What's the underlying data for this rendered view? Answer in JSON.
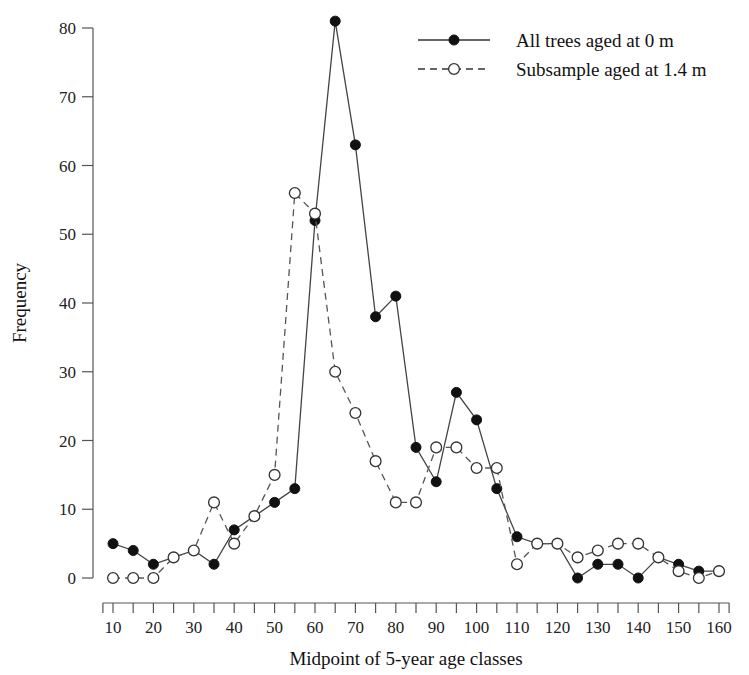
{
  "chart_data": {
    "type": "line",
    "title": "",
    "xlabel": "Midpoint of 5-year age classes",
    "ylabel": "Frequency",
    "xlim": [
      7.5,
      162.5
    ],
    "ylim": [
      0,
      84
    ],
    "grid": false,
    "legend_position": "top-right",
    "x_major_ticks": [
      10,
      20,
      30,
      40,
      50,
      60,
      70,
      80,
      90,
      100,
      110,
      120,
      130,
      140,
      150,
      160
    ],
    "x_minor_ticks": [
      15,
      25,
      35,
      45,
      55,
      65,
      75,
      85,
      95,
      105,
      115,
      125,
      135,
      145,
      155
    ],
    "y_ticks": [
      0,
      10,
      20,
      30,
      40,
      50,
      60,
      70,
      80
    ],
    "x": [
      10,
      15,
      20,
      25,
      30,
      35,
      40,
      45,
      50,
      55,
      60,
      65,
      70,
      75,
      80,
      85,
      90,
      95,
      100,
      105,
      110,
      115,
      120,
      125,
      130,
      135,
      140,
      145,
      150,
      155,
      160
    ],
    "series": [
      {
        "name": "All trees aged at 0 m",
        "marker": "filled-circle",
        "line": "solid",
        "color": "#111111",
        "values": [
          5,
          4,
          2,
          3,
          4,
          2,
          7,
          9,
          11,
          13,
          52,
          81,
          63,
          38,
          41,
          19,
          14,
          27,
          23,
          13,
          6,
          5,
          5,
          0,
          2,
          2,
          0,
          3,
          2,
          1,
          1
        ]
      },
      {
        "name": "Subsample aged at 1.4 m",
        "marker": "open-circle",
        "line": "dashed",
        "color": "#333333",
        "values": [
          0,
          0,
          0,
          3,
          4,
          11,
          5,
          9,
          15,
          56,
          53,
          30,
          24,
          17,
          11,
          11,
          19,
          19,
          16,
          16,
          2,
          5,
          5,
          3,
          4,
          5,
          5,
          3,
          1,
          0,
          1
        ]
      }
    ]
  },
  "legend": {
    "entries": [
      {
        "label": "All trees aged at 0 m",
        "marker": "filled-circle",
        "line": "solid"
      },
      {
        "label": "Subsample aged at 1.4 m",
        "marker": "open-circle",
        "line": "dashed"
      }
    ]
  },
  "axes": {
    "x_title": "Midpoint of 5-year age classes",
    "y_title": "Frequency"
  }
}
